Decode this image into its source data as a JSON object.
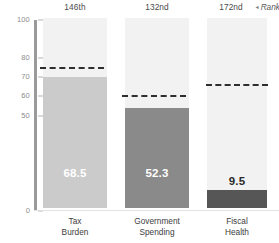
{
  "chart_data": {
    "type": "bar",
    "title": "",
    "xlabel": "",
    "ylabel": "",
    "ylim": [
      0,
      100
    ],
    "grid": false,
    "categories": [
      "Tax Burden",
      "Government Spending",
      "Fiscal Health"
    ],
    "values": [
      68.5,
      52.3,
      9.5
    ],
    "value_labels": [
      "68.5",
      "52.3",
      "9.5"
    ],
    "ranks": [
      "146th",
      "132nd",
      "172nd"
    ],
    "reference_lines": [
      75,
      60,
      66
    ],
    "ytick_labels": [
      "100",
      "80",
      "70",
      "60",
      "50",
      "0"
    ],
    "ytick_values": [
      100,
      80,
      70,
      60,
      50,
      0
    ],
    "series": [
      {
        "name": "Score",
        "values": [
          68.5,
          52.3,
          9.5
        ],
        "colors": [
          "#cbcbcb",
          "#8a8a8a",
          "#565656"
        ]
      }
    ],
    "annotations": {
      "rank_note": "Rank",
      "rank_note_marker": "◂"
    }
  },
  "colors": {
    "bar_light": "#cbcbcb",
    "bar_medium": "#8a8a8a",
    "bar_dark": "#565656",
    "band": "#f2f2f2",
    "axis": "#9a9a9a",
    "refline": "#2e2e2e",
    "tick_text": "#8d8d8d",
    "label_text": "#3d3d3d"
  }
}
